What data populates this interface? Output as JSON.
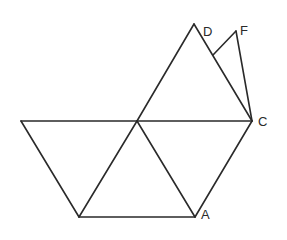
{
  "diagram": {
    "type": "geometry-figure",
    "stroke_color": "#2a2a2a",
    "background": "#ffffff",
    "points": {
      "L": {
        "x": 21,
        "y": 121
      },
      "O": {
        "x": 137,
        "y": 121
      },
      "C": {
        "x": 252,
        "y": 121
      },
      "B": {
        "x": 79,
        "y": 217
      },
      "A": {
        "x": 195,
        "y": 217
      },
      "D": {
        "x": 194,
        "y": 24
      },
      "F": {
        "x": 236,
        "y": 31
      },
      "G": {
        "x": 213,
        "y": 55
      }
    },
    "edges": [
      [
        "L",
        "C"
      ],
      [
        "L",
        "B"
      ],
      [
        "B",
        "A"
      ],
      [
        "B",
        "O"
      ],
      [
        "O",
        "A"
      ],
      [
        "A",
        "C"
      ],
      [
        "O",
        "D"
      ],
      [
        "D",
        "C"
      ],
      [
        "G",
        "F"
      ],
      [
        "F",
        "C"
      ]
    ],
    "labels": [
      {
        "text": "D",
        "x": 203,
        "y": 36
      },
      {
        "text": "F",
        "x": 240,
        "y": 35
      },
      {
        "text": "C",
        "x": 258,
        "y": 126
      },
      {
        "text": "A",
        "x": 201,
        "y": 219
      }
    ]
  }
}
